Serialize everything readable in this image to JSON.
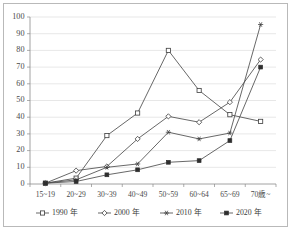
{
  "chart_data": {
    "type": "line",
    "title": "",
    "subtitle": "",
    "xlabel": "",
    "ylabel": "",
    "ylim": [
      0,
      100
    ],
    "ytick_step": 10,
    "yticks": [
      0,
      10,
      20,
      30,
      40,
      50,
      60,
      70,
      80,
      90,
      100
    ],
    "grid": true,
    "legend_position": "bottom",
    "categories": [
      "15~19",
      "20~29",
      "30~39",
      "40~49",
      "50~59",
      "60~64",
      "65~69",
      "70歳~"
    ],
    "series": [
      {
        "name": "1990 年",
        "marker": "open-square",
        "values": [
          0.5,
          3.5,
          29,
          42.5,
          80,
          56,
          41.5,
          37.5
        ]
      },
      {
        "name": "2000 年",
        "marker": "open-diamond",
        "values": [
          0.5,
          8,
          10.5,
          27,
          40.5,
          37,
          49,
          74.5
        ]
      },
      {
        "name": "2010 年",
        "marker": "star",
        "values": [
          0.5,
          2.5,
          10,
          12,
          31,
          27,
          30.5,
          95.5
        ]
      },
      {
        "name": "2020 年",
        "marker": "filled-square",
        "values": [
          0.5,
          1.5,
          5.5,
          8.5,
          13,
          14,
          26,
          70
        ]
      }
    ],
    "colors": {
      "line": "#4d4d4d",
      "grid": "#d6d6d6",
      "axis": "#8a8a8a",
      "text": "#3a3a3a",
      "background": "#ffffff",
      "frame": "#b9b9b9"
    }
  },
  "legend": {
    "items": [
      {
        "label": "1990 年",
        "marker": "open-square"
      },
      {
        "label": "2000 年",
        "marker": "open-diamond"
      },
      {
        "label": "2010 年",
        "marker": "star"
      },
      {
        "label": "2020 年",
        "marker": "filled-square"
      }
    ]
  },
  "axes": {
    "y_tick_labels": [
      "0",
      "10",
      "20",
      "30",
      "40",
      "50",
      "60",
      "70",
      "80",
      "90",
      "100"
    ],
    "x_tick_labels": [
      "15~19",
      "20~29",
      "30~39",
      "40~49",
      "50~59",
      "60~64",
      "65~69",
      "70歳~"
    ]
  }
}
